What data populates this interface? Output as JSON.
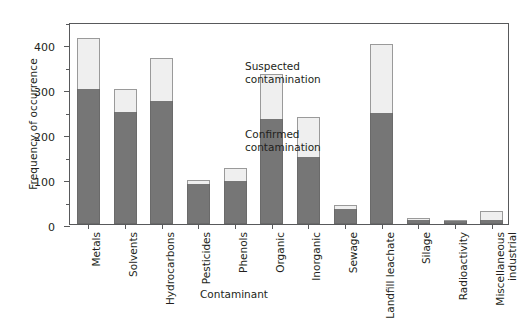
{
  "chart_data": {
    "type": "bar",
    "subtype": "stacked-bar",
    "title": "",
    "xlabel": "Contaminant",
    "ylabel": "Frequency of occurrence",
    "ylim": [
      0,
      450
    ],
    "yticks": [
      0,
      100,
      200,
      300,
      400
    ],
    "ytick_labels": [
      "0",
      "100",
      "200",
      "300",
      "400"
    ],
    "minor_yticks": [
      50,
      150,
      250,
      350,
      450
    ],
    "grid": false,
    "legend_position": "in-plot-annotation",
    "categories": [
      "Metals",
      "Solvents",
      "Hydrocarbons",
      "Pesticides",
      "Phenols",
      "Organic",
      "Inorganic",
      "Sewage",
      "Landfill leachate",
      "Silage",
      "Radioactivity",
      "Miscellaneous\nindustrial"
    ],
    "series": [
      {
        "name": "Confirmed contamination",
        "color": "#767676",
        "values": [
          300,
          250,
          275,
          90,
          95,
          235,
          150,
          33,
          248,
          10,
          7,
          8
        ]
      },
      {
        "name": "Suspected contamination",
        "color": "#efefef",
        "values": [
          115,
          50,
          95,
          8,
          30,
          100,
          88,
          9,
          152,
          3,
          2,
          20
        ]
      }
    ],
    "totals": [
      415,
      300,
      370,
      98,
      125,
      335,
      238,
      42,
      400,
      13,
      9,
      28
    ],
    "annotations": [
      {
        "id": "suspected",
        "text": "Suspected\ncontamination"
      },
      {
        "id": "confirmed",
        "text": "Confirmed\ncontamination"
      }
    ]
  },
  "axis": {
    "y_title": "Frequency of occurrence",
    "x_title": "Contaminant"
  }
}
